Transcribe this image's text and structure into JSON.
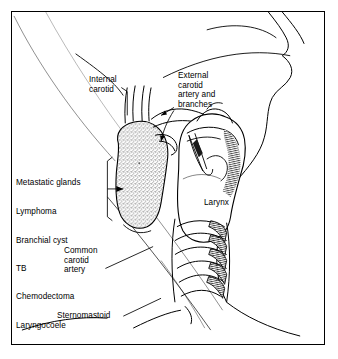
{
  "figure": {
    "type": "anatomical-line-drawing",
    "background_color": "#ffffff",
    "ink_color": "#000000",
    "border_color": "#000000",
    "mass_fill": "stipple-grey"
  },
  "labels": {
    "internal_carotid": "Internal\ncarotid",
    "external_carotid": "External\ncarotid\nartery and\nbranches",
    "larynx": "Larynx",
    "common_carotid": "Common\ncarotid\nartery",
    "sternomastoid": "Sternomastoid"
  },
  "differential_list": {
    "items": [
      "Metastatic glands",
      "Lymphoma",
      "Branchial cyst",
      "TB",
      "Chemodectoma",
      "Laryngocoele"
    ]
  },
  "structures": [
    {
      "name": "sternomastoid-muscle",
      "render": "diagonal-hatching"
    },
    {
      "name": "trapezius-muscle",
      "render": "diagonal-hatching"
    },
    {
      "name": "thyroid-cartilage",
      "render": "outline-with-hatching"
    },
    {
      "name": "trachea-rings",
      "render": "stacked-arcs"
    },
    {
      "name": "neck-mass",
      "render": "stipple"
    },
    {
      "name": "carotid-vessels",
      "render": "line-pair"
    },
    {
      "name": "jaw-profile",
      "render": "outline"
    },
    {
      "name": "clavicle",
      "render": "outline"
    }
  ]
}
